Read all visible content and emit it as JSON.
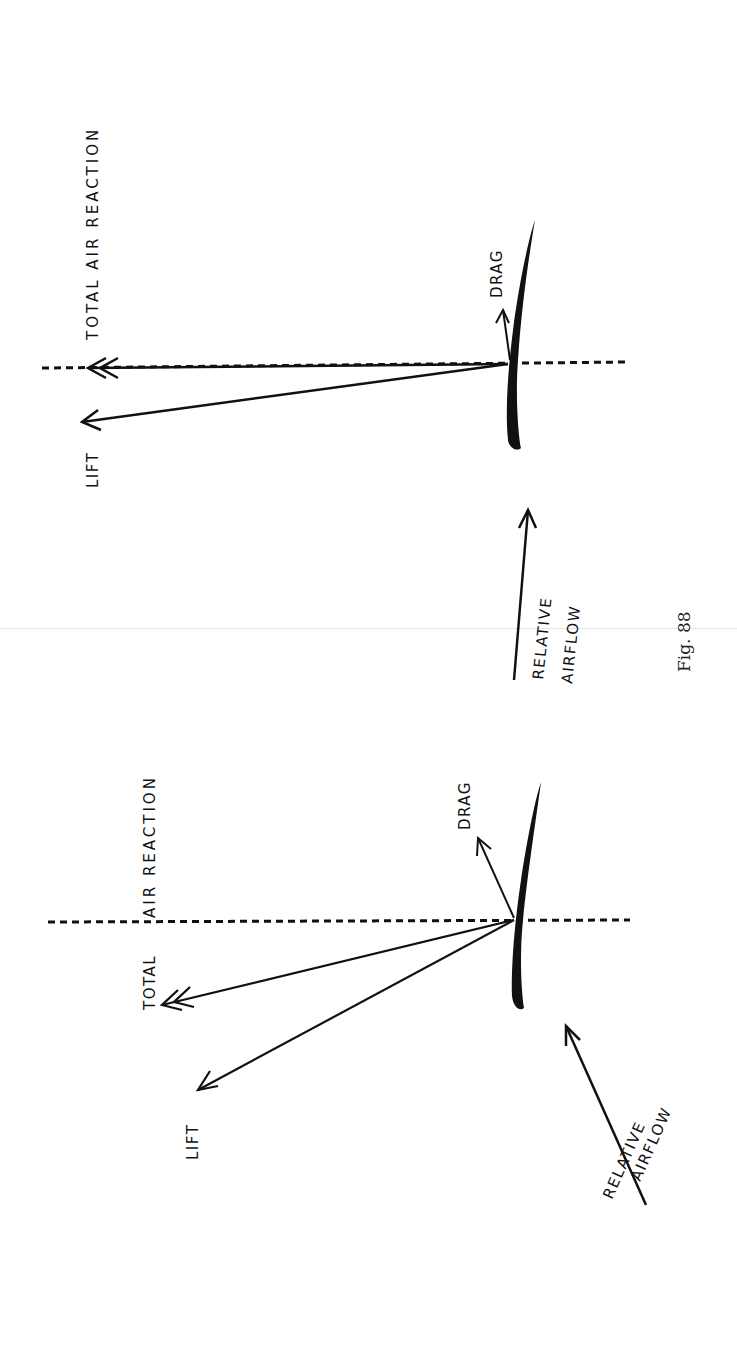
{
  "figure": {
    "caption": "Fig. 88",
    "orientation": "rotated 90° counter-clockwise on page",
    "colors": {
      "ink": "#111111",
      "paper": "#ffffff"
    }
  },
  "diagrams": [
    {
      "id": "upper",
      "labels": {
        "total_air_reaction": "TOTAL  AIR  REACTION",
        "lift": "LIFT",
        "drag": "DRAG",
        "relative_airflow_line1": "RELATIVE",
        "relative_airflow_line2": "AIRFLOW"
      },
      "description": "Aerofoil at small angle of attack; total air reaction nearly perpendicular to airflow, small drag"
    },
    {
      "id": "lower",
      "labels": {
        "total_air_reaction_a": "TOTAL",
        "total_air_reaction_b": "AIR  REACTION",
        "lift": "LIFT",
        "drag": "DRAG",
        "relative_airflow_line1": "RELATIVE",
        "relative_airflow_line2": "AIRFLOW"
      },
      "description": "Aerofoil at larger angle of attack; total air reaction tilted back, larger drag"
    }
  ]
}
